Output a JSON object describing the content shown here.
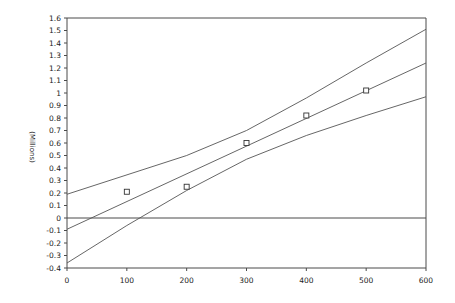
{
  "chart_data": {
    "type": "line",
    "title": "",
    "xlabel": "",
    "ylabel": "(Millions)",
    "xlim": [
      0,
      600
    ],
    "ylim": [
      -0.4,
      1.6
    ],
    "x_ticks": [
      0,
      100,
      200,
      300,
      400,
      500,
      600
    ],
    "y_ticks": [
      -0.4,
      -0.3,
      -0.2,
      -0.1,
      0,
      0.1,
      0.2,
      0.3,
      0.4,
      0.5,
      0.6,
      0.7,
      0.8,
      0.9,
      1,
      1.1,
      1.2,
      1.3,
      1.4,
      1.5,
      1.6
    ],
    "y_tick_labels": [
      "-0.4",
      "-0.3",
      "-0.2",
      "-0.1",
      "0",
      "0.1",
      "0.2",
      "0.3",
      "0.4",
      "0.5",
      "0.6",
      "0.7",
      "0.8",
      "0.9",
      "1",
      "1.1",
      "1.2",
      "1.3",
      "1.4",
      "1.5",
      "1.6"
    ],
    "grid": false,
    "legend": null,
    "reference_lines": [
      {
        "axis": "y",
        "value": 0
      }
    ],
    "series": [
      {
        "name": "Observed",
        "style": "scatter-square",
        "x": [
          100,
          200,
          300,
          400,
          500
        ],
        "y": [
          0.21,
          0.25,
          0.6,
          0.82,
          1.02
        ]
      },
      {
        "name": "Fitted line",
        "style": "line",
        "x": [
          0,
          600
        ],
        "y": [
          -0.09,
          1.24
        ]
      },
      {
        "name": "Upper band",
        "style": "line",
        "x": [
          0,
          200,
          300,
          400,
          500,
          600
        ],
        "y": [
          0.19,
          0.5,
          0.7,
          0.96,
          1.24,
          1.51
        ]
      },
      {
        "name": "Lower band",
        "style": "line",
        "x": [
          0,
          100,
          200,
          300,
          400,
          500,
          600
        ],
        "y": [
          -0.36,
          -0.06,
          0.22,
          0.47,
          0.66,
          0.82,
          0.97
        ]
      }
    ]
  },
  "layout": {
    "plot_left": 67,
    "plot_right": 426,
    "plot_top": 18,
    "plot_bottom": 268
  }
}
